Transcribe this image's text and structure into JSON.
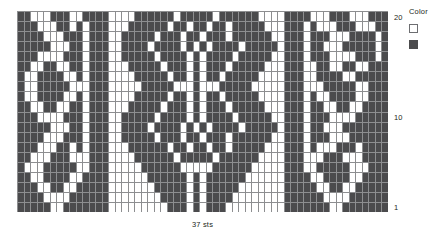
{
  "caption": {
    "stitches_label": "37 sts"
  },
  "legend": {
    "title": "Color",
    "items": [
      {
        "name": "main-color",
        "swatch": "light",
        "hex": "#ffffff"
      },
      {
        "name": "contrast-color",
        "swatch": "dark",
        "hex": "#4b4b4d"
      }
    ]
  },
  "row_labels": [
    {
      "value": "20",
      "row": 20
    },
    {
      "value": "10",
      "row": 10
    },
    {
      "value": "1",
      "row": 1
    }
  ],
  "colors": {
    "light": "#ffffff",
    "dark": "#4b4b4d",
    "gridline": "#8d8e90",
    "text": "#231f20"
  },
  "chart_data": {
    "type": "heatmap",
    "title": "",
    "xlabel": "37 sts",
    "ylabel": "",
    "columns": 57,
    "rows": 20,
    "grid": true,
    "legend_position": "right",
    "value_map": {
      "0": "#ffffff",
      "1": "#4b4b4d"
    },
    "row_order": "top_is_row_20",
    "cells": [
      [
        1,
        1,
        0,
        0,
        0,
        1,
        1,
        1,
        0,
        0,
        1,
        1,
        1,
        1,
        0,
        0,
        0,
        0,
        1,
        1,
        1,
        1,
        1,
        1,
        0,
        1,
        1,
        1,
        1,
        1,
        0,
        1,
        1,
        1,
        1,
        1,
        1,
        0,
        0,
        0,
        0,
        1,
        1,
        1,
        1,
        0,
        0,
        0,
        1,
        1,
        1,
        0,
        0,
        0,
        1,
        1,
        1
      ],
      [
        1,
        1,
        1,
        0,
        0,
        0,
        1,
        1,
        0,
        1,
        0,
        1,
        1,
        1,
        0,
        0,
        0,
        1,
        1,
        1,
        1,
        1,
        1,
        0,
        1,
        1,
        0,
        1,
        1,
        0,
        1,
        1,
        0,
        1,
        1,
        1,
        1,
        1,
        0,
        0,
        0,
        1,
        1,
        1,
        0,
        1,
        0,
        0,
        0,
        1,
        1,
        1,
        0,
        0,
        0,
        1,
        1
      ],
      [
        1,
        1,
        1,
        1,
        0,
        0,
        0,
        1,
        1,
        1,
        0,
        1,
        1,
        1,
        0,
        0,
        1,
        1,
        1,
        1,
        1,
        0,
        1,
        1,
        1,
        0,
        1,
        1,
        0,
        1,
        1,
        1,
        0,
        1,
        1,
        1,
        1,
        1,
        1,
        0,
        0,
        1,
        1,
        1,
        0,
        1,
        1,
        1,
        0,
        0,
        0,
        1,
        1,
        1,
        1,
        0,
        1
      ],
      [
        1,
        1,
        1,
        1,
        1,
        0,
        0,
        0,
        1,
        1,
        0,
        1,
        1,
        1,
        0,
        0,
        1,
        1,
        1,
        1,
        0,
        1,
        1,
        1,
        1,
        0,
        1,
        0,
        1,
        0,
        1,
        1,
        1,
        1,
        0,
        1,
        1,
        1,
        1,
        1,
        0,
        1,
        1,
        1,
        0,
        1,
        1,
        0,
        0,
        0,
        1,
        1,
        1,
        1,
        1,
        0,
        1
      ],
      [
        1,
        1,
        1,
        0,
        0,
        0,
        0,
        1,
        1,
        1,
        0,
        1,
        1,
        1,
        0,
        0,
        1,
        1,
        1,
        1,
        1,
        0,
        1,
        1,
        1,
        1,
        0,
        1,
        0,
        1,
        1,
        1,
        1,
        0,
        1,
        1,
        1,
        1,
        1,
        0,
        0,
        1,
        1,
        1,
        0,
        1,
        1,
        1,
        0,
        0,
        0,
        0,
        1,
        1,
        1,
        0,
        1
      ],
      [
        1,
        1,
        0,
        0,
        1,
        1,
        0,
        0,
        1,
        1,
        0,
        1,
        1,
        1,
        0,
        0,
        0,
        1,
        1,
        1,
        1,
        1,
        0,
        1,
        1,
        1,
        0,
        1,
        0,
        1,
        1,
        1,
        0,
        1,
        1,
        1,
        1,
        1,
        0,
        0,
        0,
        1,
        1,
        1,
        0,
        0,
        1,
        1,
        0,
        0,
        1,
        1,
        0,
        0,
        1,
        1,
        1
      ],
      [
        1,
        0,
        0,
        1,
        1,
        1,
        1,
        0,
        0,
        1,
        0,
        1,
        1,
        1,
        0,
        0,
        0,
        0,
        1,
        1,
        1,
        1,
        1,
        0,
        1,
        1,
        0,
        1,
        0,
        1,
        1,
        0,
        1,
        1,
        1,
        1,
        1,
        0,
        0,
        0,
        0,
        1,
        1,
        1,
        0,
        0,
        1,
        1,
        1,
        1,
        0,
        0,
        1,
        1,
        1,
        1,
        1
      ],
      [
        1,
        0,
        0,
        1,
        1,
        1,
        1,
        1,
        0,
        0,
        0,
        1,
        1,
        1,
        0,
        0,
        0,
        0,
        0,
        1,
        1,
        1,
        1,
        1,
        0,
        0,
        0,
        1,
        0,
        0,
        0,
        1,
        1,
        1,
        1,
        1,
        0,
        0,
        0,
        0,
        0,
        1,
        1,
        1,
        0,
        0,
        0,
        1,
        1,
        1,
        1,
        1,
        0,
        0,
        1,
        1,
        1
      ],
      [
        1,
        0,
        0,
        1,
        1,
        1,
        1,
        0,
        0,
        1,
        0,
        1,
        1,
        1,
        0,
        0,
        0,
        0,
        1,
        1,
        1,
        1,
        1,
        0,
        1,
        1,
        0,
        1,
        0,
        1,
        1,
        0,
        1,
        1,
        1,
        1,
        1,
        0,
        0,
        0,
        0,
        1,
        1,
        1,
        0,
        1,
        0,
        0,
        1,
        1,
        1,
        1,
        0,
        0,
        1,
        1,
        1
      ],
      [
        1,
        1,
        0,
        0,
        1,
        1,
        0,
        0,
        1,
        1,
        0,
        1,
        1,
        1,
        0,
        0,
        0,
        1,
        1,
        1,
        1,
        1,
        0,
        1,
        1,
        1,
        0,
        1,
        0,
        1,
        1,
        1,
        0,
        1,
        1,
        1,
        1,
        1,
        0,
        0,
        0,
        1,
        1,
        1,
        0,
        1,
        1,
        0,
        0,
        1,
        1,
        0,
        0,
        1,
        1,
        1,
        1
      ],
      [
        1,
        1,
        1,
        0,
        0,
        0,
        0,
        1,
        1,
        1,
        0,
        1,
        1,
        1,
        0,
        0,
        1,
        1,
        1,
        1,
        1,
        0,
        1,
        1,
        1,
        1,
        0,
        1,
        0,
        1,
        1,
        1,
        1,
        0,
        1,
        1,
        1,
        1,
        1,
        0,
        0,
        1,
        1,
        1,
        0,
        1,
        1,
        1,
        0,
        0,
        0,
        0,
        1,
        1,
        1,
        1,
        1
      ],
      [
        1,
        1,
        1,
        1,
        1,
        0,
        0,
        0,
        1,
        1,
        0,
        1,
        1,
        1,
        0,
        0,
        1,
        1,
        1,
        1,
        0,
        1,
        1,
        1,
        1,
        0,
        1,
        0,
        1,
        0,
        1,
        1,
        1,
        1,
        0,
        1,
        1,
        1,
        1,
        1,
        0,
        1,
        1,
        1,
        0,
        1,
        1,
        0,
        0,
        0,
        1,
        1,
        1,
        1,
        1,
        1,
        1
      ],
      [
        1,
        1,
        1,
        1,
        0,
        0,
        0,
        1,
        1,
        1,
        0,
        1,
        1,
        1,
        0,
        0,
        1,
        1,
        1,
        1,
        1,
        0,
        1,
        1,
        1,
        0,
        1,
        1,
        0,
        1,
        1,
        1,
        0,
        1,
        1,
        1,
        1,
        1,
        1,
        0,
        0,
        1,
        1,
        1,
        0,
        1,
        1,
        1,
        0,
        0,
        0,
        1,
        1,
        1,
        1,
        1,
        1
      ],
      [
        1,
        1,
        1,
        0,
        0,
        0,
        1,
        1,
        0,
        1,
        0,
        1,
        1,
        1,
        0,
        0,
        0,
        1,
        1,
        1,
        1,
        1,
        1,
        0,
        1,
        1,
        0,
        1,
        1,
        0,
        1,
        1,
        0,
        1,
        1,
        1,
        1,
        1,
        0,
        0,
        0,
        1,
        1,
        1,
        0,
        1,
        0,
        0,
        0,
        1,
        1,
        1,
        0,
        1,
        1,
        1,
        1
      ],
      [
        1,
        1,
        0,
        0,
        0,
        1,
        1,
        1,
        0,
        0,
        0,
        1,
        1,
        1,
        0,
        0,
        0,
        0,
        1,
        1,
        1,
        1,
        1,
        1,
        0,
        1,
        1,
        1,
        1,
        1,
        0,
        1,
        1,
        1,
        1,
        1,
        1,
        0,
        0,
        0,
        0,
        1,
        1,
        1,
        0,
        0,
        0,
        1,
        1,
        1,
        0,
        0,
        0,
        1,
        1,
        1,
        1
      ],
      [
        1,
        0,
        0,
        0,
        1,
        1,
        1,
        1,
        1,
        0,
        0,
        1,
        1,
        1,
        0,
        0,
        0,
        0,
        0,
        1,
        1,
        1,
        1,
        1,
        1,
        0,
        0,
        0,
        0,
        0,
        1,
        1,
        1,
        1,
        1,
        1,
        0,
        0,
        0,
        0,
        0,
        1,
        1,
        1,
        0,
        0,
        1,
        1,
        1,
        1,
        1,
        0,
        0,
        0,
        1,
        1,
        1
      ],
      [
        1,
        1,
        0,
        0,
        1,
        1,
        1,
        1,
        0,
        0,
        1,
        1,
        1,
        1,
        0,
        0,
        0,
        0,
        0,
        0,
        1,
        1,
        1,
        1,
        1,
        1,
        0,
        1,
        0,
        1,
        1,
        1,
        1,
        1,
        1,
        0,
        0,
        0,
        0,
        0,
        0,
        1,
        1,
        1,
        1,
        0,
        0,
        1,
        1,
        1,
        1,
        0,
        0,
        1,
        1,
        1,
        1
      ],
      [
        1,
        1,
        1,
        0,
        0,
        1,
        1,
        0,
        0,
        1,
        1,
        1,
        1,
        1,
        0,
        0,
        0,
        0,
        0,
        0,
        0,
        1,
        1,
        1,
        1,
        1,
        0,
        1,
        0,
        1,
        1,
        1,
        1,
        1,
        0,
        0,
        0,
        0,
        0,
        0,
        0,
        1,
        1,
        1,
        1,
        1,
        0,
        0,
        1,
        1,
        0,
        0,
        1,
        1,
        1,
        1,
        1
      ],
      [
        1,
        1,
        1,
        1,
        0,
        0,
        0,
        0,
        1,
        1,
        1,
        1,
        1,
        1,
        0,
        0,
        0,
        0,
        0,
        0,
        0,
        0,
        1,
        1,
        1,
        1,
        0,
        1,
        0,
        1,
        1,
        1,
        1,
        0,
        0,
        0,
        0,
        0,
        0,
        0,
        0,
        1,
        1,
        1,
        1,
        1,
        1,
        0,
        0,
        0,
        0,
        1,
        1,
        1,
        1,
        1,
        1
      ],
      [
        1,
        1,
        1,
        1,
        1,
        0,
        0,
        1,
        1,
        1,
        1,
        1,
        1,
        1,
        0,
        0,
        0,
        0,
        0,
        0,
        0,
        0,
        0,
        1,
        1,
        1,
        0,
        1,
        0,
        1,
        1,
        1,
        0,
        0,
        0,
        0,
        0,
        0,
        0,
        0,
        0,
        1,
        1,
        1,
        1,
        1,
        1,
        1,
        0,
        0,
        1,
        1,
        1,
        1,
        1,
        1,
        1
      ]
    ]
  }
}
